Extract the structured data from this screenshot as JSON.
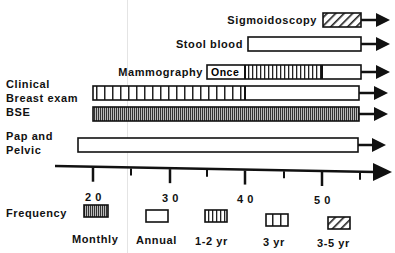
{
  "rows": [
    {
      "name": "sigmoidoscopy",
      "label": "Sigmoidoscopy",
      "segments": [
        {
          "pattern": "hatch",
          "from": 323,
          "to": 361
        }
      ],
      "arrow_end": 390,
      "y": 13
    },
    {
      "name": "stool-blood",
      "label": "Stool  blood",
      "segments": [
        {
          "pattern": "annual",
          "from": 248,
          "to": 361
        }
      ],
      "arrow_end": 390,
      "y": 37
    },
    {
      "name": "mammography",
      "label": "Mammography",
      "segments": [
        {
          "pattern": "once",
          "from": 207,
          "to": 245,
          "text": "Once"
        },
        {
          "pattern": "oneTwo",
          "from": 245,
          "to": 322
        },
        {
          "pattern": "annual",
          "from": 322,
          "to": 361
        }
      ],
      "arrow_end": 390,
      "y": 65
    },
    {
      "name": "clinical-breast-exam",
      "label_lines": [
        "Clinical",
        "Breast  exam"
      ],
      "segments": [
        {
          "pattern": "three",
          "from": 93,
          "to": 245
        },
        {
          "pattern": "annual",
          "from": 245,
          "to": 359
        }
      ],
      "arrow_end": 388,
      "y": 86
    },
    {
      "name": "bse",
      "label": "BSE",
      "segments": [
        {
          "pattern": "monthly",
          "from": 93,
          "to": 359
        }
      ],
      "arrow_end": 388,
      "y": 107
    },
    {
      "name": "pap-and-pelvic",
      "label_lines": [
        "Pap and",
        "Pelvic"
      ],
      "segments": [
        {
          "pattern": "annual",
          "from": 78,
          "to": 358
        }
      ],
      "arrow_end": 386,
      "y": 138
    }
  ],
  "axis": {
    "ticks_major": [
      {
        "label": "2 0",
        "x": 93
      },
      {
        "label": "3 0",
        "x": 170
      },
      {
        "label": "4 0",
        "x": 245
      },
      {
        "label": "5 0",
        "x": 322
      }
    ],
    "ticks_minor": [
      131,
      207,
      284,
      360
    ]
  },
  "legend": {
    "title": "Frequency",
    "items": [
      {
        "pattern": "monthly",
        "label": "Monthly"
      },
      {
        "pattern": "annual",
        "label": "Annual"
      },
      {
        "pattern": "oneTwo",
        "label": "1-2   yr"
      },
      {
        "pattern": "three",
        "label": "3   yr"
      },
      {
        "pattern": "hatch",
        "label": "3-5   yr"
      }
    ]
  }
}
